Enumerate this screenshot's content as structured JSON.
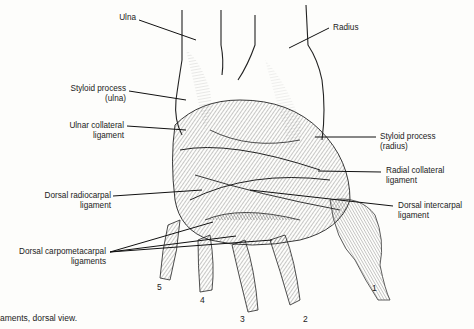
{
  "figure": {
    "caption": "aments, dorsal view.",
    "labels": {
      "ulna": "Ulna",
      "radius": "Radius",
      "styloid_ulna_1": "Styloid process",
      "styloid_ulna_2": "(ulna)",
      "ulnar_collateral_1": "Ulnar collateral",
      "ulnar_collateral_2": "ligament",
      "styloid_radius_1": "Styloid process",
      "styloid_radius_2": "(radius)",
      "radial_collateral_1": "Radial collateral",
      "radial_collateral_2": "ligament",
      "dorsal_radiocarpal_1": "Dorsal radiocarpal",
      "dorsal_radiocarpal_2": "ligament",
      "dorsal_intercarpal_1": "Dorsal intercarpal",
      "dorsal_intercarpal_2": "ligament",
      "dorsal_cmc_1": "Dorsal carpometacarpal",
      "dorsal_cmc_2": "ligaments"
    },
    "metacarpal_numbers": {
      "m1": "1",
      "m2": "2",
      "m3": "3",
      "m4": "4",
      "m5": "5"
    },
    "colors": {
      "background": "#fdfdfb",
      "ink": "#1a1a1a",
      "shade": "#555555"
    }
  }
}
